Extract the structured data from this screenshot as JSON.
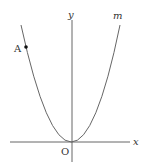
{
  "diagram": {
    "type": "parabola-graph",
    "axes": {
      "x_label": "x",
      "y_label": "y",
      "origin_label": "O"
    },
    "curve": {
      "label": "m",
      "description": "upward-opening parabola with vertex at origin"
    },
    "points": [
      {
        "label": "A",
        "description": "point on left branch of parabola m"
      }
    ],
    "colors": {
      "axis": "#555555",
      "curve": "#666666",
      "point": "#111111",
      "text": "#333333"
    }
  }
}
